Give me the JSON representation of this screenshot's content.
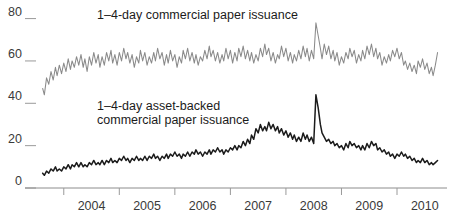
{
  "chart_data": {
    "type": "line",
    "title": "",
    "xlabel": "",
    "ylabel": "",
    "ylim": [
      0,
      85
    ],
    "xlim": [
      2003.5,
      2010.9
    ],
    "grid": false,
    "legend_position": "inline-annotations",
    "y_ticks": [
      "0",
      "20",
      "40",
      "60",
      "80"
    ],
    "y_tick_values": [
      0,
      20,
      40,
      60,
      80
    ],
    "x_ticks": [
      "2004",
      "2005",
      "2006",
      "2007",
      "2008",
      "2009",
      "2010"
    ],
    "x_tick_values": [
      2004,
      2005,
      2006,
      2007,
      2008,
      2009,
      2010
    ],
    "annotations": [
      {
        "name": "commercial-paper-label",
        "text": "1–4-day commercial paper issuance",
        "lines": [
          "1–4-day commercial paper issuance"
        ],
        "x": 2004.6,
        "y": 80,
        "color": "#1b1b1b"
      },
      {
        "name": "asset-backed-label",
        "text": "1–4-day asset-backed commercial paper issuance",
        "lines": [
          "1–4-day asset-backed",
          "commercial paper issuance"
        ],
        "x": 2004.6,
        "y": 37,
        "color": "#1b1b1b"
      }
    ],
    "series": [
      {
        "name": "1–4-day commercial paper issuance",
        "color": "#8a8a8a",
        "linewidth": 1.05,
        "x": [
          2003.62,
          2003.65,
          2003.69,
          2003.73,
          2003.77,
          2003.81,
          2003.85,
          2003.88,
          2003.92,
          2003.96,
          2004.0,
          2004.04,
          2004.08,
          2004.12,
          2004.15,
          2004.19,
          2004.23,
          2004.27,
          2004.31,
          2004.35,
          2004.38,
          2004.42,
          2004.46,
          2004.5,
          2004.54,
          2004.58,
          2004.62,
          2004.65,
          2004.69,
          2004.73,
          2004.77,
          2004.81,
          2004.85,
          2004.88,
          2004.92,
          2004.96,
          2005.0,
          2005.04,
          2005.08,
          2005.12,
          2005.15,
          2005.19,
          2005.23,
          2005.27,
          2005.31,
          2005.35,
          2005.38,
          2005.42,
          2005.46,
          2005.5,
          2005.54,
          2005.58,
          2005.62,
          2005.65,
          2005.69,
          2005.73,
          2005.77,
          2005.81,
          2005.85,
          2005.88,
          2005.92,
          2005.96,
          2006.0,
          2006.04,
          2006.08,
          2006.12,
          2006.15,
          2006.19,
          2006.23,
          2006.27,
          2006.31,
          2006.35,
          2006.38,
          2006.42,
          2006.46,
          2006.5,
          2006.54,
          2006.58,
          2006.62,
          2006.65,
          2006.69,
          2006.73,
          2006.77,
          2006.81,
          2006.85,
          2006.88,
          2006.92,
          2006.96,
          2007.0,
          2007.04,
          2007.08,
          2007.12,
          2007.15,
          2007.19,
          2007.23,
          2007.27,
          2007.31,
          2007.35,
          2007.38,
          2007.42,
          2007.46,
          2007.5,
          2007.54,
          2007.58,
          2007.62,
          2007.65,
          2007.69,
          2007.73,
          2007.77,
          2007.81,
          2007.85,
          2007.88,
          2007.92,
          2007.96,
          2008.0,
          2008.04,
          2008.08,
          2008.12,
          2008.15,
          2008.19,
          2008.23,
          2008.27,
          2008.31,
          2008.35,
          2008.38,
          2008.42,
          2008.46,
          2008.5,
          2008.54,
          2008.58,
          2008.62,
          2008.65,
          2008.69,
          2008.73,
          2008.77,
          2008.81,
          2008.85,
          2008.88,
          2008.92,
          2008.96,
          2009.0,
          2009.04,
          2009.08,
          2009.12,
          2009.15,
          2009.19,
          2009.23,
          2009.27,
          2009.31,
          2009.35,
          2009.38,
          2009.42,
          2009.46,
          2009.5,
          2009.54,
          2009.58,
          2009.62,
          2009.65,
          2009.69,
          2009.73,
          2009.77,
          2009.81,
          2009.85,
          2009.88,
          2009.92,
          2009.96,
          2010.0,
          2010.04,
          2010.08,
          2010.12,
          2010.15,
          2010.19,
          2010.23,
          2010.27,
          2010.31,
          2010.35,
          2010.38,
          2010.42,
          2010.46,
          2010.5,
          2010.54,
          2010.58,
          2010.62,
          2010.65,
          2010.69,
          2010.73
        ],
        "values": [
          47,
          44,
          52,
          49,
          55,
          51,
          57,
          53,
          58,
          54,
          59,
          55,
          61,
          56,
          60,
          57,
          62,
          58,
          63,
          57,
          61,
          55,
          62,
          58,
          64,
          59,
          63,
          57,
          62,
          58,
          64,
          60,
          65,
          59,
          63,
          58,
          64,
          60,
          66,
          61,
          64,
          59,
          63,
          57,
          62,
          59,
          65,
          60,
          64,
          58,
          62,
          59,
          64,
          60,
          66,
          61,
          64,
          58,
          63,
          59,
          65,
          60,
          63,
          57,
          62,
          59,
          65,
          61,
          66,
          60,
          64,
          59,
          63,
          58,
          62,
          60,
          65,
          61,
          67,
          62,
          65,
          60,
          64,
          59,
          63,
          60,
          66,
          61,
          65,
          59,
          64,
          60,
          66,
          62,
          67,
          61,
          65,
          60,
          64,
          59,
          63,
          60,
          66,
          62,
          68,
          63,
          66,
          60,
          64,
          59,
          63,
          61,
          67,
          62,
          66,
          60,
          64,
          59,
          63,
          60,
          65,
          61,
          67,
          62,
          66,
          60,
          65,
          61,
          78,
          72,
          66,
          61,
          68,
          63,
          67,
          61,
          65,
          60,
          64,
          58,
          62,
          59,
          64,
          61,
          66,
          62,
          65,
          59,
          63,
          60,
          65,
          61,
          67,
          63,
          68,
          62,
          66,
          61,
          64,
          58,
          62,
          59,
          63,
          60,
          65,
          62,
          66,
          61,
          64,
          58,
          60,
          56,
          59,
          55,
          58,
          54,
          60,
          57,
          61,
          56,
          59,
          54,
          57,
          53,
          58,
          64
        ]
      },
      {
        "name": "1–4-day asset-backed commercial paper issuance",
        "color": "#1b1b1b",
        "linewidth": 1.5,
        "x": [
          2003.62,
          2003.65,
          2003.69,
          2003.73,
          2003.77,
          2003.81,
          2003.85,
          2003.88,
          2003.92,
          2003.96,
          2004.0,
          2004.04,
          2004.08,
          2004.12,
          2004.15,
          2004.19,
          2004.23,
          2004.27,
          2004.31,
          2004.35,
          2004.38,
          2004.42,
          2004.46,
          2004.5,
          2004.54,
          2004.58,
          2004.62,
          2004.65,
          2004.69,
          2004.73,
          2004.77,
          2004.81,
          2004.85,
          2004.88,
          2004.92,
          2004.96,
          2005.0,
          2005.04,
          2005.08,
          2005.12,
          2005.15,
          2005.19,
          2005.23,
          2005.27,
          2005.31,
          2005.35,
          2005.38,
          2005.42,
          2005.46,
          2005.5,
          2005.54,
          2005.58,
          2005.62,
          2005.65,
          2005.69,
          2005.73,
          2005.77,
          2005.81,
          2005.85,
          2005.88,
          2005.92,
          2005.96,
          2006.0,
          2006.04,
          2006.08,
          2006.12,
          2006.15,
          2006.19,
          2006.23,
          2006.27,
          2006.31,
          2006.35,
          2006.38,
          2006.42,
          2006.46,
          2006.5,
          2006.54,
          2006.58,
          2006.62,
          2006.65,
          2006.69,
          2006.73,
          2006.77,
          2006.81,
          2006.85,
          2006.88,
          2006.92,
          2006.96,
          2007.0,
          2007.04,
          2007.08,
          2007.12,
          2007.15,
          2007.19,
          2007.23,
          2007.27,
          2007.31,
          2007.35,
          2007.38,
          2007.42,
          2007.46,
          2007.5,
          2007.54,
          2007.58,
          2007.62,
          2007.65,
          2007.69,
          2007.73,
          2007.77,
          2007.81,
          2007.85,
          2007.88,
          2007.92,
          2007.96,
          2008.0,
          2008.04,
          2008.08,
          2008.12,
          2008.15,
          2008.19,
          2008.23,
          2008.27,
          2008.31,
          2008.35,
          2008.38,
          2008.42,
          2008.46,
          2008.5,
          2008.54,
          2008.58,
          2008.62,
          2008.65,
          2008.69,
          2008.73,
          2008.77,
          2008.81,
          2008.85,
          2008.88,
          2008.92,
          2008.96,
          2009.0,
          2009.04,
          2009.08,
          2009.12,
          2009.15,
          2009.19,
          2009.23,
          2009.27,
          2009.31,
          2009.35,
          2009.38,
          2009.42,
          2009.46,
          2009.5,
          2009.54,
          2009.58,
          2009.62,
          2009.65,
          2009.69,
          2009.73,
          2009.77,
          2009.81,
          2009.85,
          2009.88,
          2009.92,
          2009.96,
          2010.0,
          2010.04,
          2010.08,
          2010.12,
          2010.15,
          2010.19,
          2010.23,
          2010.27,
          2010.31,
          2010.35,
          2010.38,
          2010.42,
          2010.46,
          2010.5,
          2010.54,
          2010.58,
          2010.62,
          2010.65,
          2010.69,
          2010.73
        ],
        "values": [
          7,
          6,
          8,
          7,
          9,
          8,
          10,
          8,
          9,
          8,
          10,
          9,
          11,
          9,
          11,
          10,
          12,
          10,
          12,
          10,
          11,
          10,
          12,
          11,
          13,
          11,
          12,
          11,
          13,
          11,
          13,
          12,
          14,
          12,
          13,
          12,
          14,
          13,
          15,
          13,
          14,
          12,
          14,
          13,
          15,
          13,
          14,
          13,
          15,
          13,
          15,
          14,
          16,
          14,
          15,
          13,
          15,
          14,
          16,
          14,
          16,
          15,
          17,
          15,
          16,
          14,
          16,
          15,
          17,
          15,
          17,
          16,
          18,
          16,
          17,
          15,
          17,
          16,
          18,
          16,
          18,
          17,
          19,
          17,
          18,
          16,
          18,
          17,
          19,
          18,
          20,
          18,
          20,
          19,
          22,
          20,
          23,
          21,
          25,
          23,
          28,
          26,
          30,
          27,
          29,
          27,
          31,
          28,
          30,
          27,
          29,
          26,
          28,
          25,
          27,
          24,
          26,
          23,
          25,
          22,
          24,
          22,
          26,
          23,
          25,
          22,
          24,
          21,
          44,
          38,
          30,
          26,
          24,
          22,
          23,
          21,
          22,
          20,
          21,
          19,
          20,
          18,
          21,
          19,
          22,
          20,
          21,
          19,
          20,
          18,
          20,
          18,
          21,
          19,
          22,
          20,
          21,
          18,
          19,
          17,
          18,
          16,
          17,
          15,
          16,
          14,
          16,
          15,
          17,
          15,
          16,
          14,
          15,
          13,
          14,
          12,
          13,
          12,
          14,
          12,
          13,
          11,
          12,
          11,
          12,
          13
        ]
      }
    ]
  }
}
